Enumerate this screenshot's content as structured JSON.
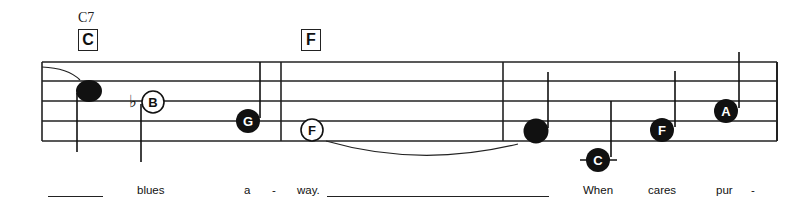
{
  "chords": [
    {
      "name": "C7",
      "box": "C",
      "x": 77
    },
    {
      "name": null,
      "box": "F",
      "x": 300
    }
  ],
  "staff": {
    "lines_y": [
      62,
      81,
      101,
      121,
      141
    ],
    "x_start": 42,
    "x_end": 777,
    "barlines_x": [
      281,
      503,
      777
    ]
  },
  "notes": [
    {
      "letter": "",
      "style": "filled-plain",
      "x": 89,
      "y": 91
    },
    {
      "letter": "B",
      "accidental": "♭",
      "style": "open",
      "x": 152,
      "y": 101
    },
    {
      "letter": "G",
      "style": "filled",
      "x": 247,
      "y": 121
    },
    {
      "letter": "F",
      "style": "open",
      "x": 312,
      "y": 131
    },
    {
      "letter": "",
      "style": "filled-plain",
      "x": 536,
      "y": 131
    },
    {
      "letter": "C",
      "style": "filled",
      "x": 598,
      "y": 160
    },
    {
      "letter": "F",
      "style": "filled",
      "x": 662,
      "y": 131
    },
    {
      "letter": "A",
      "style": "filled",
      "x": 726,
      "y": 111
    }
  ],
  "lyrics": [
    {
      "text": "blues",
      "x": 137
    },
    {
      "text": "a",
      "x": 244
    },
    {
      "text": "-",
      "x": 272
    },
    {
      "text": "way.",
      "x": 297
    },
    {
      "text": "When",
      "x": 583
    },
    {
      "text": "cares",
      "x": 648
    },
    {
      "text": "pur",
      "x": 716
    },
    {
      "text": "-",
      "x": 751
    }
  ],
  "lyric_extenders": [
    {
      "x": 48,
      "width": 55
    },
    {
      "x": 327,
      "width": 222
    }
  ]
}
